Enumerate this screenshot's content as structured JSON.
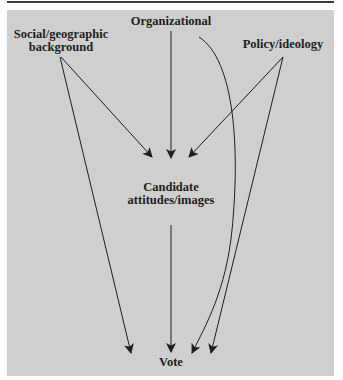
{
  "diagram": {
    "nodes": {
      "organizational": {
        "label": "Organizational"
      },
      "social": {
        "line1": "Social/geographic",
        "line2": "background"
      },
      "policy": {
        "label": "Policy/ideology"
      },
      "candidate": {
        "line1": "Candidate",
        "line2": "attitudes/images"
      },
      "vote": {
        "label": "Vote"
      }
    },
    "edges": [
      {
        "from": "Social/geographic background",
        "to": "Candidate attitudes/images"
      },
      {
        "from": "Social/geographic background",
        "to": "Vote"
      },
      {
        "from": "Organizational",
        "to": "Candidate attitudes/images"
      },
      {
        "from": "Organizational",
        "to": "Vote",
        "style": "curved"
      },
      {
        "from": "Policy/ideology",
        "to": "Candidate attitudes/images"
      },
      {
        "from": "Policy/ideology",
        "to": "Vote"
      },
      {
        "from": "Candidate attitudes/images",
        "to": "Vote"
      }
    ],
    "colors": {
      "panel": "#cfcfcf",
      "ink": "#1e1e1e",
      "rule": "#3a3a3a"
    }
  }
}
